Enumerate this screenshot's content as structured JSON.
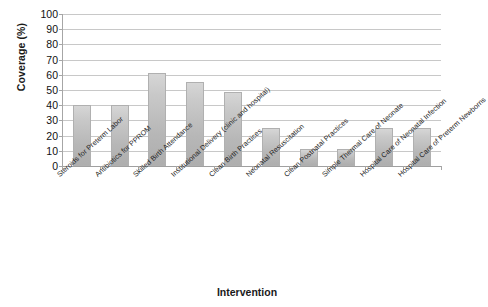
{
  "chart_data": {
    "type": "bar",
    "title": "",
    "xlabel": "Intervention",
    "ylabel": "Coverage (%)",
    "ylim": [
      0,
      100
    ],
    "ytick_step": 10,
    "yticks": [
      100,
      90,
      80,
      70,
      60,
      50,
      40,
      30,
      20,
      10,
      0
    ],
    "grid": true,
    "legend": "none",
    "bar_color": "#c2c2c2",
    "categories": [
      "Steroids for Preterm Labor",
      "Antibiotics for PPROM",
      "Skilled Birth Attendance",
      "Institutional Delivery (clinic and hospital)",
      "Clean Birth Practices",
      "Neonatal Resuscitation",
      "Clean Postnatal Practices",
      "Simple Thermal Care of Neonate",
      "Hospital Care of Neonatal Infection",
      "Hospital Care of Preterm Newborns"
    ],
    "values": [
      40,
      40,
      61,
      55,
      49,
      25,
      11,
      11,
      25,
      25
    ]
  },
  "axes": {
    "y_title": "Coverage (%)",
    "x_title": "Intervention"
  }
}
